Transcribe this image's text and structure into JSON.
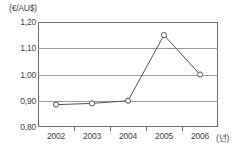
{
  "chart_data": {
    "type": "line",
    "title": "",
    "subtitle": "",
    "xlabel": "(년)",
    "ylabel": "(€/AU$)",
    "categories": [
      "2002",
      "2003",
      "2004",
      "2005",
      "2006"
    ],
    "values": [
      0.885,
      0.89,
      0.9,
      1.15,
      1.0
    ],
    "series": [
      {
        "name": "€/AU$ exchange rate",
        "values": [
          0.885,
          0.89,
          0.9,
          1.15,
          1.0
        ]
      }
    ],
    "ylim": [
      0.8,
      1.2
    ],
    "ytick_labels": [
      "1,20",
      "1,10",
      "1,00",
      "0,90",
      "0,80"
    ],
    "ytick_values": [
      1.2,
      1.1,
      1.0,
      0.9,
      0.8
    ],
    "xtick_labels": [
      "2002",
      "2003",
      "2004",
      "2005",
      "2006"
    ],
    "grid": true,
    "grid_axis": "y",
    "legend": false,
    "legend_position": "none",
    "marker": "open-circle",
    "line_color": "#555555",
    "grid_color": "#9a9a9a",
    "frame_color": "#6e6e6e",
    "marker_fill": "#ffffff",
    "text_color": "#3f3f3f"
  },
  "axes": {
    "y_unit_label": "(€/AU$)",
    "x_unit_label": "(년)"
  }
}
